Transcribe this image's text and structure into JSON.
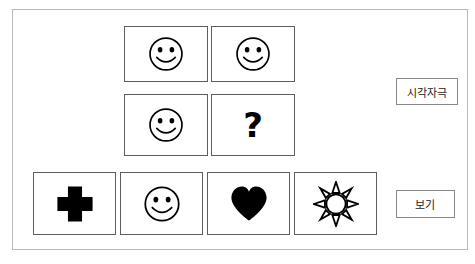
{
  "slide": {
    "type": "visual-matrix-reasoning-item",
    "background_color": "#ffffff",
    "frame_color": "#b9b9b9"
  },
  "labels": {
    "stimulus": "시각자극",
    "options": "보기"
  },
  "matrix": {
    "rows": 2,
    "cols": 2,
    "cells": [
      {
        "position": "r1c1",
        "icon": "smiley-face-icon",
        "label": "smiley face"
      },
      {
        "position": "r1c2",
        "icon": "smiley-face-icon",
        "label": "smiley face"
      },
      {
        "position": "r2c1",
        "icon": "smiley-face-icon",
        "label": "smiley face"
      },
      {
        "position": "r2c2",
        "icon": "question-mark-icon",
        "label": "?"
      }
    ],
    "missing_cell": "r2c2",
    "missing_symbol": "?"
  },
  "options": {
    "count": 4,
    "items": [
      {
        "index": 1,
        "icon": "cross-icon",
        "label": "black cross",
        "fill": "#000000"
      },
      {
        "index": 2,
        "icon": "smiley-face-icon",
        "label": "smiley face",
        "fill": "#ffffff"
      },
      {
        "index": 3,
        "icon": "heart-icon",
        "label": "black heart",
        "fill": "#000000"
      },
      {
        "index": 4,
        "icon": "sun-icon",
        "label": "outlined sun",
        "fill": "#ffffff"
      }
    ]
  },
  "colors": {
    "ink": "#000000",
    "cell_border": "#5e5e5e",
    "label_border": "#888888"
  }
}
